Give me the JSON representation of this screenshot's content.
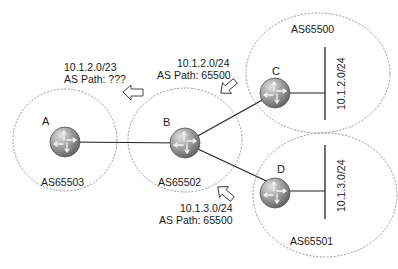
{
  "diagram": {
    "autonomous_systems": [
      {
        "id": "as-a",
        "label": "AS65503",
        "router": "A"
      },
      {
        "id": "as-b",
        "label": "AS65502",
        "router": "B"
      },
      {
        "id": "as-c",
        "label": "AS65500",
        "router": "C",
        "network": "10.1.2.0/24"
      },
      {
        "id": "as-d",
        "label": "AS65501",
        "router": "D",
        "network": "10.1.3.0/24"
      }
    ],
    "routers": {
      "a": "A",
      "b": "B",
      "c": "C",
      "d": "D"
    },
    "networks": {
      "c_net": "10.1.2.0/24",
      "d_net": "10.1.3.0/24"
    },
    "advertisements": {
      "to_a": {
        "prefix": "10.1.2.0/23",
        "as_path": "AS Path:  ???"
      },
      "from_c": {
        "prefix": "10.1.2.0/24",
        "as_path": "AS Path: 65500"
      },
      "from_d": {
        "prefix": "10.1.3.0/24",
        "as_path": "AS Path: 65500"
      }
    },
    "links": [
      {
        "from": "A",
        "to": "B"
      },
      {
        "from": "B",
        "to": "C"
      },
      {
        "from": "B",
        "to": "D"
      }
    ]
  },
  "colors": {
    "router_fill": "#8a8a8a",
    "router_highlight": "#d8d8d8",
    "boundary": "#888888",
    "line": "#222222"
  }
}
